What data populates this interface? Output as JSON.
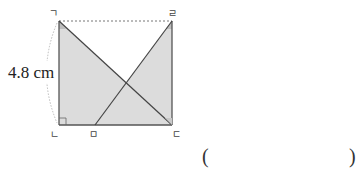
{
  "figure": {
    "type": "geometry-rectangle",
    "vertices": {
      "top_left": "ㄱ",
      "bottom_left": "ㄴ",
      "bottom_right": "ㄷ",
      "top_right": "ㄹ",
      "bottom_point": "ㅁ"
    },
    "side_length_label": "4.8 cm",
    "segments": [
      "ㄱㄷ",
      "ㄹㅁ"
    ],
    "shaded_regions": [
      "triangle ㄱㄴㄷ",
      "triangle ㄹㅁㄷ"
    ],
    "right_angle_marks": [
      "ㄴ"
    ],
    "colors": {
      "shade": "#dcdcdc",
      "line": "#555555",
      "dashed": "#777777"
    }
  },
  "answer": {
    "open_paren": "(",
    "close_paren": ")",
    "value": ""
  }
}
